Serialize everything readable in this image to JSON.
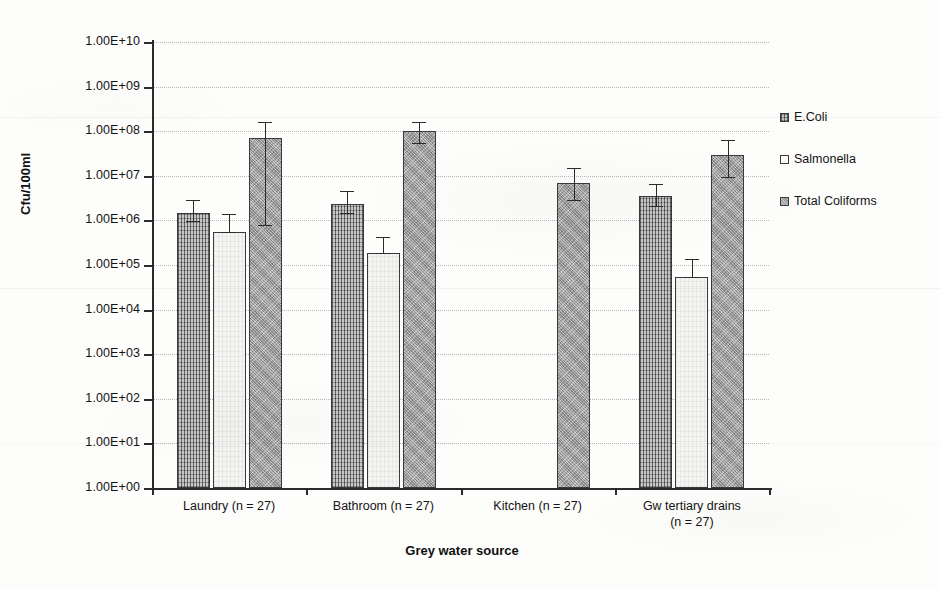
{
  "chart_data": {
    "type": "bar",
    "title": "",
    "xlabel": "Grey water source",
    "ylabel": "Cfu/100ml",
    "yscale": "log",
    "ylim": [
      1,
      10000000000
    ],
    "grid": true,
    "legend_position": "right",
    "ytick_labels": [
      "1.00E+10",
      "1.00E+09",
      "1.00E+08",
      "1.00E+07",
      "1.00E+06",
      "1.00E+05",
      "1.00E+04",
      "1.00E+03",
      "1.00E+02",
      "1.00E+01",
      "1.00E+00"
    ],
    "ytick_values": [
      10000000000.0,
      1000000000.0,
      100000000.0,
      10000000.0,
      1000000.0,
      100000.0,
      10000.0,
      1000.0,
      100.0,
      10.0,
      1.0
    ],
    "categories": [
      "Laundry (n = 27)",
      "Bathroom (n = 27)",
      "Kitchen (n = 27)",
      "Gw tertiary drains (n = 27)"
    ],
    "category_lines": [
      [
        "Laundry (n = 27)"
      ],
      [
        "Bathroom (n = 27)"
      ],
      [
        "Kitchen (n = 27)"
      ],
      [
        "Gw tertiary drains",
        "(n = 27)"
      ]
    ],
    "series": [
      {
        "name": "E.Coli",
        "color": "#8a8a8a",
        "pattern": "crosshatch",
        "values": [
          1500000,
          2300000,
          null,
          3500000
        ],
        "err_low": [
          1500000,
          2300000,
          null,
          3500000
        ],
        "err_high": [
          1200000,
          2500000,
          null,
          3300000
        ],
        "err_low_abs": [
          950000,
          1500000,
          null,
          2100000
        ],
        "err_high_abs": [
          2800000,
          4500000,
          null,
          6500000
        ]
      },
      {
        "name": "Salmonella",
        "color": "#f4f4f2",
        "pattern": "plain",
        "values": [
          550000,
          190000,
          null,
          55000
        ],
        "err_low_abs": [
          550000,
          190000,
          null,
          55000
        ],
        "err_high_abs": [
          1400000,
          420000,
          null,
          135000
        ]
      },
      {
        "name": "Total Coliforms",
        "color": "#a6a6a6",
        "pattern": "stipple",
        "values": [
          70000000,
          100000000,
          7000000,
          30000000
        ],
        "err_low_abs": [
          800000,
          55000000,
          2800000,
          9500000
        ],
        "err_high_abs": [
          160000000,
          165000000,
          15000000,
          62000000
        ]
      }
    ]
  },
  "legend": {
    "items": [
      {
        "label": "E.Coli"
      },
      {
        "label": "Salmonella"
      },
      {
        "label": "Total Coliforms"
      }
    ]
  }
}
